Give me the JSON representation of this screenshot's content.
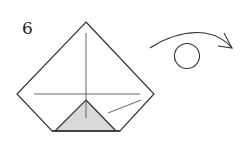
{
  "diagram": {
    "type": "origami-step",
    "step_number": "6",
    "colors": {
      "line": "#333333",
      "crease": "#555555",
      "shaded_flap": "#d9d9d9",
      "background": "#ffffff"
    },
    "symbols": {
      "turn_over": "turn-over-arrow-icon"
    }
  }
}
